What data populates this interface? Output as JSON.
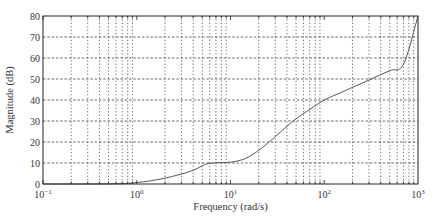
{
  "chart_data": {
    "type": "line",
    "title": "",
    "xlabel": "Frequency (rad/s)",
    "ylabel": "Magnitude (dB)",
    "xscale": "log",
    "xlim": [
      0.1,
      1000
    ],
    "ylim": [
      0,
      80
    ],
    "grid": true,
    "grid_style": "dotted",
    "legend": null,
    "x_ticks": [
      {
        "value": 0.1,
        "base": "10",
        "exp": "−1"
      },
      {
        "value": 1,
        "base": "10",
        "exp": "0"
      },
      {
        "value": 10,
        "base": "10",
        "exp": "1"
      },
      {
        "value": 100,
        "base": "10",
        "exp": "2"
      },
      {
        "value": 1000,
        "base": "10",
        "exp": "3"
      }
    ],
    "y_ticks": [
      0,
      10,
      20,
      30,
      40,
      50,
      60,
      70,
      80
    ],
    "series": [
      {
        "name": "Magnitude",
        "color": "#555555",
        "x": [
          0.1,
          0.3,
          0.6,
          0.8,
          1.0,
          1.4,
          2.0,
          2.7,
          3.5,
          4.2,
          5.0,
          5.6,
          7.0,
          8.5,
          10,
          12,
          15,
          20,
          25,
          30,
          40,
          50,
          70,
          100,
          150,
          200,
          300,
          500,
          700,
          1000
        ],
        "y": [
          0,
          0,
          0.1,
          0.3,
          0.7,
          1.5,
          2.8,
          4.2,
          5.6,
          7.0,
          8.6,
          9.6,
          10.1,
          10.2,
          10.4,
          11.0,
          12.5,
          16.0,
          19.5,
          22.5,
          27.5,
          31.0,
          35.5,
          40.0,
          43.5,
          46.0,
          49.5,
          54.0,
          57.0,
          80.0
        ]
      }
    ]
  }
}
